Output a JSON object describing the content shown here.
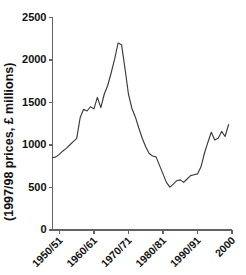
{
  "chart_data": {
    "type": "line",
    "title": "",
    "subtitle": "",
    "xlabel": "",
    "ylabel": "(1997/98 prices, £ millions)",
    "xlim": [
      1948,
      2000
    ],
    "ylim": [
      0,
      2500
    ],
    "grid": false,
    "legend": null,
    "legend_position": "none",
    "y_ticks": [
      0,
      500,
      1000,
      1500,
      2000,
      2500
    ],
    "y_tick_labels": [
      "0",
      "500",
      "1000",
      "1500",
      "2000",
      "2500"
    ],
    "x_ticks": [
      1950,
      1960,
      1970,
      1980,
      1990,
      2000
    ],
    "x_tick_labels": [
      "1950/51",
      "1960/61",
      "1970/71",
      "1980/81",
      "1990/91",
      "2000"
    ],
    "series": [
      {
        "name": "expenditure",
        "color": "#3a3a3a",
        "x": [
          1948,
          1949,
          1950,
          1951,
          1952,
          1953,
          1954,
          1955,
          1956,
          1957,
          1958,
          1959,
          1960,
          1961,
          1962,
          1963,
          1964,
          1965,
          1966,
          1967,
          1968,
          1969,
          1970,
          1971,
          1972,
          1973,
          1974,
          1975,
          1976,
          1977,
          1978,
          1979,
          1980,
          1981,
          1982,
          1983,
          1984,
          1985,
          1986,
          1987,
          1988,
          1989,
          1990,
          1991,
          1992,
          1993,
          1994,
          1995,
          1996,
          1997,
          1998,
          1999
        ],
        "values": [
          850,
          860,
          890,
          930,
          960,
          1000,
          1040,
          1075,
          1320,
          1420,
          1400,
          1450,
          1425,
          1560,
          1440,
          1600,
          1700,
          1850,
          2010,
          2200,
          2180,
          1900,
          1600,
          1430,
          1330,
          1200,
          1080,
          980,
          900,
          870,
          860,
          760,
          660,
          560,
          505,
          540,
          580,
          590,
          560,
          600,
          640,
          650,
          660,
          740,
          900,
          1030,
          1150,
          1060,
          1080,
          1160,
          1100,
          1240
        ]
      }
    ]
  },
  "axis": {
    "y_axis_name": "y-axis",
    "x_axis_name": "x-axis"
  }
}
